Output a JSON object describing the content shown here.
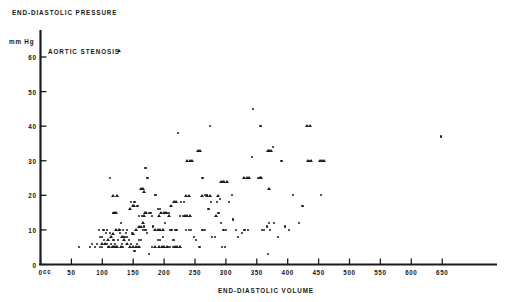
{
  "chart_data": {
    "type": "scatter",
    "title": "",
    "xlabel": "END-DIASTOLIC VOLUME",
    "ylabel": "END-DIASTOLIC PRESSURE",
    "x_unit": "cc",
    "y_unit": "mm Hg",
    "xlim": [
      0,
      700
    ],
    "ylim": [
      0,
      62
    ],
    "grid": false,
    "legend_position": "top-left",
    "x_ticks": [
      0,
      50,
      100,
      150,
      200,
      250,
      300,
      350,
      400,
      450,
      500,
      550,
      600,
      650
    ],
    "x_tick_labels": [
      "0",
      "50",
      "100",
      "150",
      "200",
      "250",
      "300",
      "350",
      "400",
      "450",
      "500",
      "550",
      "600",
      "650"
    ],
    "y_ticks": [
      0,
      10,
      20,
      30,
      40,
      50,
      60
    ],
    "y_tick_labels": [
      "0",
      "10",
      "20",
      "30",
      "40",
      "50",
      "60"
    ],
    "series": [
      {
        "name": "AORTIC STENOSIS",
        "marker": "triangle",
        "color": "#1b1b1b",
        "points": [
          [
            112,
            5
          ],
          [
            118,
            5
          ],
          [
            120,
            5
          ],
          [
            122,
            5
          ],
          [
            125,
            5
          ],
          [
            130,
            5
          ],
          [
            100,
            6
          ],
          [
            105,
            6
          ],
          [
            110,
            7
          ],
          [
            115,
            8
          ],
          [
            118,
            9
          ],
          [
            122,
            10
          ],
          [
            128,
            10
          ],
          [
            133,
            8
          ],
          [
            136,
            7
          ],
          [
            140,
            6
          ],
          [
            145,
            5
          ],
          [
            150,
            5
          ],
          [
            155,
            5
          ],
          [
            160,
            5
          ],
          [
            150,
            9
          ],
          [
            155,
            10
          ],
          [
            160,
            11
          ],
          [
            163,
            11
          ],
          [
            166,
            12
          ],
          [
            168,
            14
          ],
          [
            170,
            15
          ],
          [
            172,
            15
          ],
          [
            146,
            16
          ],
          [
            150,
            17
          ],
          [
            152,
            17
          ],
          [
            120,
            15
          ],
          [
            123,
            15
          ],
          [
            118,
            20
          ],
          [
            125,
            20
          ],
          [
            163,
            22
          ],
          [
            166,
            22
          ],
          [
            168,
            21
          ],
          [
            186,
            10
          ],
          [
            190,
            10
          ],
          [
            194,
            10
          ],
          [
            198,
            10
          ],
          [
            192,
            14
          ],
          [
            196,
            15
          ],
          [
            200,
            15
          ],
          [
            204,
            15
          ],
          [
            208,
            14
          ],
          [
            186,
            5
          ],
          [
            192,
            5
          ],
          [
            197,
            5
          ],
          [
            201,
            5
          ],
          [
            205,
            5
          ],
          [
            218,
            5
          ],
          [
            222,
            5
          ],
          [
            226,
            5
          ],
          [
            212,
            17
          ],
          [
            216,
            18
          ],
          [
            220,
            18
          ],
          [
            234,
            14
          ],
          [
            238,
            14
          ],
          [
            242,
            14
          ],
          [
            236,
            20
          ],
          [
            240,
            20
          ],
          [
            238,
            30
          ],
          [
            242,
            30
          ],
          [
            246,
            30
          ],
          [
            255,
            33
          ],
          [
            258,
            33
          ],
          [
            262,
            20
          ],
          [
            270,
            20
          ],
          [
            274,
            20
          ],
          [
            284,
            14
          ],
          [
            288,
            20
          ],
          [
            292,
            24
          ],
          [
            295,
            24
          ],
          [
            298,
            24
          ],
          [
            302,
            24
          ],
          [
            330,
            25
          ],
          [
            334,
            25
          ],
          [
            338,
            25
          ],
          [
            355,
            25
          ],
          [
            358,
            25
          ],
          [
            368,
            33
          ],
          [
            371,
            33
          ],
          [
            374,
            33
          ],
          [
            370,
            22
          ],
          [
            432,
            40
          ],
          [
            436,
            40
          ],
          [
            434,
            30
          ],
          [
            438,
            30
          ],
          [
            452,
            30
          ],
          [
            456,
            30
          ],
          [
            460,
            30
          ]
        ]
      },
      {
        "name": "NORMAL",
        "marker": "dot",
        "color": "#1b1b1b",
        "points": [
          [
            62,
            5
          ],
          [
            80,
            5
          ],
          [
            84,
            6
          ],
          [
            88,
            5
          ],
          [
            92,
            6
          ],
          [
            96,
            5
          ],
          [
            100,
            5
          ],
          [
            96,
            8
          ],
          [
            99,
            8
          ],
          [
            103,
            7
          ],
          [
            106,
            9
          ],
          [
            108,
            6
          ],
          [
            110,
            5
          ],
          [
            95,
            10
          ],
          [
            102,
            10
          ],
          [
            107,
            10
          ],
          [
            112,
            9
          ],
          [
            114,
            6
          ],
          [
            116,
            5
          ],
          [
            118,
            7
          ],
          [
            121,
            6
          ],
          [
            124,
            5
          ],
          [
            126,
            7
          ],
          [
            129,
            9
          ],
          [
            132,
            6
          ],
          [
            134,
            5
          ],
          [
            136,
            8
          ],
          [
            138,
            9
          ],
          [
            140,
            8
          ],
          [
            143,
            7
          ],
          [
            146,
            6
          ],
          [
            148,
            9
          ],
          [
            112,
            25
          ],
          [
            118,
            15
          ],
          [
            121,
            15
          ],
          [
            128,
            10
          ],
          [
            130,
            12
          ],
          [
            133,
            10
          ],
          [
            140,
            10
          ],
          [
            152,
            4
          ],
          [
            156,
            6
          ],
          [
            158,
            5
          ],
          [
            160,
            7
          ],
          [
            163,
            7
          ],
          [
            166,
            10
          ],
          [
            168,
            11
          ],
          [
            170,
            10
          ],
          [
            172,
            9
          ],
          [
            146,
            18
          ],
          [
            152,
            18
          ],
          [
            157,
            17
          ],
          [
            160,
            14
          ],
          [
            164,
            14
          ],
          [
            170,
            28
          ],
          [
            173,
            25
          ],
          [
            176,
            15
          ],
          [
            178,
            15
          ],
          [
            180,
            14
          ],
          [
            182,
            11
          ],
          [
            176,
            3
          ],
          [
            180,
            5
          ],
          [
            186,
            20
          ],
          [
            190,
            16
          ],
          [
            194,
            16
          ],
          [
            190,
            7
          ],
          [
            194,
            7
          ],
          [
            198,
            8
          ],
          [
            202,
            12
          ],
          [
            205,
            15
          ],
          [
            208,
            15
          ],
          [
            210,
            10
          ],
          [
            212,
            10
          ],
          [
            214,
            7
          ],
          [
            216,
            7
          ],
          [
            218,
            10
          ],
          [
            220,
            10
          ],
          [
            206,
            5
          ],
          [
            210,
            5
          ],
          [
            214,
            5
          ],
          [
            222,
            38
          ],
          [
            228,
            18
          ],
          [
            232,
            18
          ],
          [
            236,
            10
          ],
          [
            240,
            10
          ],
          [
            244,
            10
          ],
          [
            226,
            14
          ],
          [
            230,
            14
          ],
          [
            248,
            8
          ],
          [
            252,
            7
          ],
          [
            256,
            5
          ],
          [
            258,
            5
          ],
          [
            262,
            10
          ],
          [
            266,
            10
          ],
          [
            262,
            25
          ],
          [
            266,
            20
          ],
          [
            270,
            20
          ],
          [
            274,
            40
          ],
          [
            272,
            16
          ],
          [
            276,
            18
          ],
          [
            278,
            8
          ],
          [
            282,
            8
          ],
          [
            286,
            18
          ],
          [
            290,
            19
          ],
          [
            288,
            15
          ],
          [
            292,
            12
          ],
          [
            296,
            10
          ],
          [
            300,
            10
          ],
          [
            294,
            5
          ],
          [
            298,
            5
          ],
          [
            305,
            18
          ],
          [
            310,
            20
          ],
          [
            312,
            13
          ],
          [
            316,
            10
          ],
          [
            320,
            8
          ],
          [
            326,
            9
          ],
          [
            330,
            10
          ],
          [
            336,
            10
          ],
          [
            342,
            31
          ],
          [
            344,
            45
          ],
          [
            352,
            25
          ],
          [
            356,
            40
          ],
          [
            358,
            10
          ],
          [
            362,
            10
          ],
          [
            366,
            11
          ],
          [
            370,
            12
          ],
          [
            372,
            10
          ],
          [
            368,
            3
          ],
          [
            376,
            34
          ],
          [
            378,
            12
          ],
          [
            384,
            8
          ],
          [
            390,
            30
          ],
          [
            396,
            11
          ],
          [
            402,
            10
          ],
          [
            408,
            20
          ],
          [
            418,
            12
          ],
          [
            424,
            17
          ],
          [
            436,
            30
          ],
          [
            454,
            20
          ],
          [
            648,
            37
          ]
        ]
      }
    ]
  },
  "legend": {
    "entries": [
      {
        "label": "AORTIC STENOSIS",
        "marker": "triangle"
      }
    ]
  },
  "axes": {
    "y_axis_title": "END-DIASTOLIC PRESSURE",
    "x_axis_title": "END-DIASTOLIC VOLUME",
    "y_unit": "mm Hg",
    "x_unit": "cc"
  },
  "colors": {
    "ink": "#1b1b1b",
    "background": "#ffffff"
  }
}
